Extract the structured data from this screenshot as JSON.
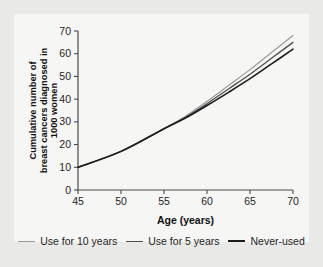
{
  "chart_data": {
    "type": "line",
    "title": "",
    "xlabel": "Age (years)",
    "ylabel": "Cumulative number of breast cancers diagnosed in 1000 women",
    "ylabel_lines": [
      "Cumulative number of",
      "breast cancers diagnosed in",
      "1000 women"
    ],
    "xlim": [
      45,
      70
    ],
    "ylim": [
      0,
      70
    ],
    "xticks": [
      "45",
      "50",
      "55",
      "60",
      "65",
      "70"
    ],
    "yticks": [
      "0",
      "10",
      "20",
      "30",
      "40",
      "50",
      "60",
      "70"
    ],
    "grid": false,
    "legend_position": "bottom",
    "x": [
      45,
      50,
      55,
      57.5,
      60,
      62.5,
      65,
      67.5,
      70
    ],
    "series": [
      {
        "name": "Use for 10 years",
        "color": "#9a9a9a",
        "width": 1.2,
        "values": [
          10,
          17,
          27,
          32.5,
          39,
          46,
          53,
          60.5,
          68
        ]
      },
      {
        "name": "Use for 5 years",
        "color": "#4f4f4f",
        "width": 1.3,
        "values": [
          10,
          17,
          27,
          32,
          38,
          44.5,
          51,
          58,
          65
        ]
      },
      {
        "name": "Never-used",
        "color": "#1c1c1c",
        "width": 1.6,
        "values": [
          10,
          17,
          27,
          31.7,
          37.2,
          43,
          49,
          55.5,
          62
        ]
      }
    ]
  },
  "legend": {
    "items": [
      {
        "label": "Use for 10 years",
        "color": "#9a9a9a",
        "width": 1.2
      },
      {
        "label": "Use for 5 years",
        "color": "#4f4f4f",
        "width": 1.6
      },
      {
        "label": "Never-used",
        "color": "#1c1c1c",
        "width": 2.1
      }
    ]
  }
}
